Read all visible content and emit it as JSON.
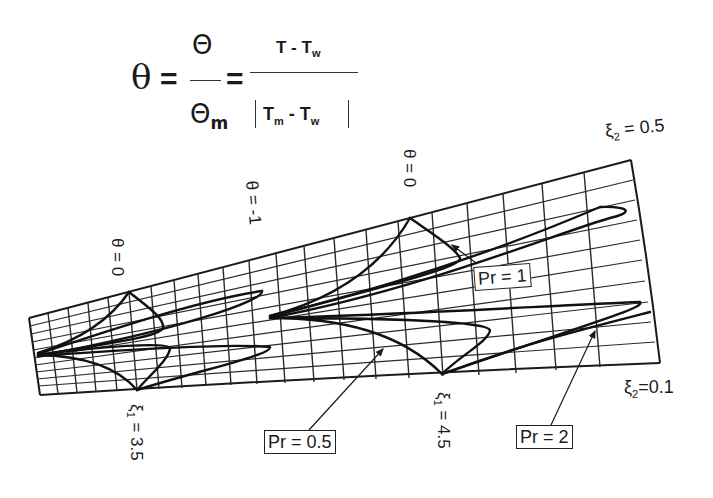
{
  "formula": {
    "lhs": "θ",
    "equals": "=",
    "frac1_num": "Θ",
    "frac1_den": "Θ",
    "frac1_den_sub": "m",
    "frac2_num_a": "T - T",
    "frac2_num_sub": "w",
    "frac2_den_a": "T",
    "frac2_den_sub_a": "m",
    "frac2_den_b": " - T",
    "frac2_den_sub_b": "w"
  },
  "labels": {
    "theta_left": "θ = 0",
    "theta_mid": "θ = -1",
    "theta_right": "θ = 0",
    "xi1_a": "ξ",
    "xi1_a_sub": "1",
    "xi1_a_val": " = 3.5",
    "xi1_b": "ξ",
    "xi1_b_sub": "1",
    "xi1_b_val": " = 4.5",
    "xi2_top": "ξ",
    "xi2_top_sub": "2",
    "xi2_top_val": " = 0.5",
    "xi2_bot": "ξ",
    "xi2_bot_sub": "2",
    "xi2_bot_val": "=0.1"
  },
  "callouts": {
    "pr1": "Pr = 1",
    "pr05": "Pr = 0.5",
    "pr2": "Pr = 2"
  },
  "colors": {
    "ink": "#1a1a1a",
    "grid": "#2a2a2a",
    "background": "#ffffff"
  }
}
